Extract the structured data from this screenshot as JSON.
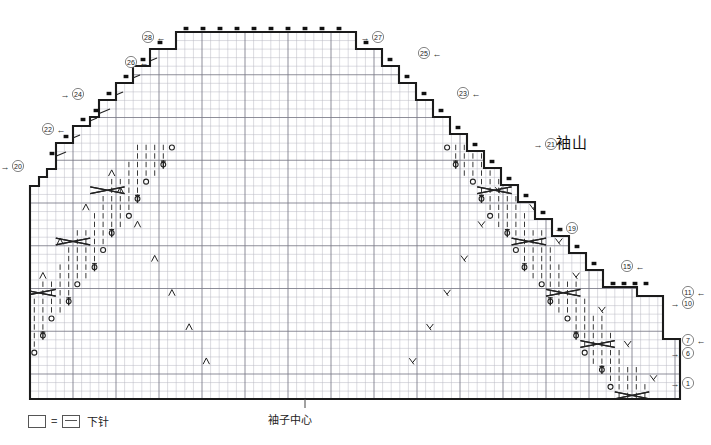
{
  "meta": {
    "title": "袖山",
    "center_label": "袖子中心",
    "width": 711,
    "height": 445
  },
  "legend": {
    "empty_symbol": "□",
    "equals": "=",
    "purl_symbol": "⊟",
    "label": "下针"
  },
  "colors": {
    "grid_light": "#b9b9c2",
    "grid_heavy": "#7a7a86",
    "outline": "#1b1b1b",
    "symbol": "#222222",
    "marker": "#111111",
    "background": "#ffffff"
  },
  "chart_data": {
    "type": "table",
    "title": "袖山",
    "xlabel": "",
    "ylabel": "",
    "grid": {
      "origin_x": 30,
      "origin_y": 32,
      "cell_w": 8.6,
      "cell_h": 8.55,
      "cols": 76,
      "rows": 46,
      "heavy_every": 5,
      "grid_on": true
    },
    "outline_points": [
      [
        30,
        194
      ],
      [
        30,
        186
      ],
      [
        39,
        186
      ],
      [
        39,
        177
      ],
      [
        47,
        177
      ],
      [
        47,
        169
      ],
      [
        56,
        169
      ],
      [
        56,
        160
      ],
      [
        56,
        143
      ],
      [
        73,
        143
      ],
      [
        73,
        126
      ],
      [
        90,
        126
      ],
      [
        90,
        117
      ],
      [
        99,
        117
      ],
      [
        99,
        100
      ],
      [
        116,
        100
      ],
      [
        116,
        83
      ],
      [
        133,
        83
      ],
      [
        133,
        66
      ],
      [
        150,
        66
      ],
      [
        150,
        49
      ],
      [
        176,
        49
      ],
      [
        176,
        32
      ],
      [
        356,
        32
      ],
      [
        356,
        49
      ],
      [
        382,
        49
      ],
      [
        382,
        66
      ],
      [
        399,
        66
      ],
      [
        399,
        83
      ],
      [
        416,
        83
      ],
      [
        416,
        100
      ],
      [
        433,
        100
      ],
      [
        433,
        117
      ],
      [
        450,
        117
      ],
      [
        450,
        134
      ],
      [
        467,
        134
      ],
      [
        467,
        151
      ],
      [
        484,
        151
      ],
      [
        484,
        168
      ],
      [
        501,
        168
      ],
      [
        501,
        185
      ],
      [
        518,
        185
      ],
      [
        518,
        202
      ],
      [
        535,
        202
      ],
      [
        535,
        219
      ],
      [
        552,
        219
      ],
      [
        552,
        236
      ],
      [
        569,
        236
      ],
      [
        569,
        253
      ],
      [
        586,
        253
      ],
      [
        586,
        270
      ],
      [
        603,
        270
      ],
      [
        603,
        287
      ],
      [
        637,
        287
      ],
      [
        637,
        296
      ],
      [
        663,
        296
      ],
      [
        663,
        339
      ],
      [
        680,
        339
      ],
      [
        680,
        399
      ],
      [
        30,
        399
      ],
      [
        30,
        194
      ]
    ],
    "row_markers_left": [
      {
        "number": "28",
        "arrow": "←",
        "x": 148,
        "y": 37
      },
      {
        "number": "26",
        "arrow": "←",
        "x": 131,
        "y": 62
      },
      {
        "number": "24",
        "arrow": "→",
        "x": 78,
        "y": 94
      },
      {
        "number": "22",
        "arrow": "←",
        "x": 48,
        "y": 129
      },
      {
        "number": "20",
        "arrow": "→",
        "x": 18,
        "y": 166
      }
    ],
    "row_markers_right": [
      {
        "number": "27",
        "arrow": "→",
        "x": 378,
        "y": 37
      },
      {
        "number": "25",
        "arrow": "←",
        "x": 424,
        "y": 53
      },
      {
        "number": "23",
        "arrow": "←",
        "x": 463,
        "y": 93
      },
      {
        "number": "21",
        "arrow": "→",
        "x": 551,
        "y": 144
      },
      {
        "number": "19",
        "arrow": "→",
        "x": 572,
        "y": 228
      },
      {
        "number": "15",
        "arrow": "←",
        "x": 627,
        "y": 266
      },
      {
        "number": "11",
        "arrow": "←",
        "x": 688,
        "y": 292
      },
      {
        "number": "10",
        "arrow": "→",
        "x": 688,
        "y": 303
      },
      {
        "number": "7",
        "arrow": "←",
        "x": 688,
        "y": 340
      },
      {
        "number": "6",
        "arrow": "→",
        "x": 688,
        "y": 353
      },
      {
        "number": "1",
        "arrow": "→",
        "x": 688,
        "y": 383
      }
    ],
    "symbols_note": "grid of knitting symbols: purl bars, yarn-over circles, bobbles, left/right decreases, and 4-stitch cable crosses arranged in two mirrored diagonal panels converging at the sleeve centre"
  }
}
